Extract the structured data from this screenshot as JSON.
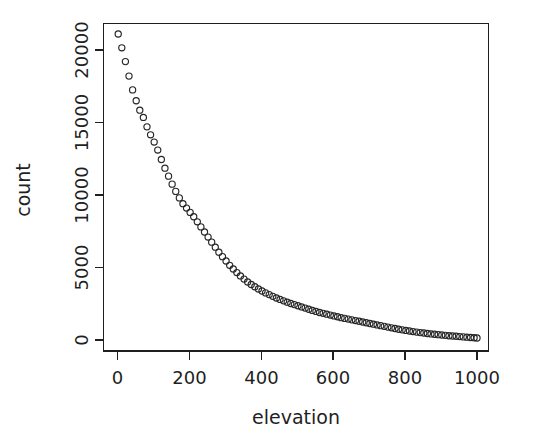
{
  "figure": {
    "background_color": "#ffffff",
    "foreground_color": "#1f1f1f",
    "point_color": "#262626",
    "width": 533,
    "height": 448
  },
  "chart_data": {
    "type": "scatter",
    "title": "",
    "subtitle": "",
    "xlabel": "elevation",
    "ylabel": "count",
    "xlim": [
      -25,
      1025
    ],
    "ylim": [
      -700,
      22400
    ],
    "grid": false,
    "legend": null,
    "legend_position": "none",
    "marker": "open-circle",
    "marker_size_px": 6.2,
    "xticks": [
      0,
      200,
      400,
      600,
      800,
      1000
    ],
    "xtick_labels": [
      "0",
      "200",
      "400",
      "600",
      "800",
      "1000"
    ],
    "yticks": [
      0,
      5000,
      10000,
      15000,
      20000
    ],
    "ytick_labels": [
      "0",
      "5000",
      "10000",
      "15000",
      "20000"
    ],
    "ytick_label_rotation": 90,
    "annotations": [],
    "series": [
      {
        "name": "elevation histogram counts",
        "x": [
          2,
          12,
          22,
          32,
          42,
          52,
          62,
          72,
          82,
          92,
          102,
          112,
          122,
          132,
          142,
          152,
          162,
          172,
          182,
          192,
          202,
          212,
          222,
          232,
          242,
          252,
          262,
          272,
          282,
          292,
          302,
          312,
          322,
          332,
          342,
          352,
          362,
          372,
          382,
          392,
          402,
          412,
          422,
          432,
          442,
          452,
          462,
          472,
          482,
          492,
          502,
          512,
          522,
          532,
          542,
          552,
          562,
          572,
          582,
          592,
          602,
          612,
          622,
          632,
          642,
          652,
          662,
          672,
          682,
          692,
          702,
          712,
          722,
          732,
          742,
          752,
          762,
          772,
          782,
          792,
          802,
          812,
          822,
          832,
          842,
          852,
          862,
          872,
          882,
          892,
          902,
          912,
          922,
          932,
          942,
          952,
          962,
          972,
          982,
          992,
          1000
        ],
        "y": [
          21100,
          20150,
          19200,
          18200,
          17250,
          16500,
          15850,
          15350,
          14700,
          14150,
          13650,
          13100,
          12450,
          11850,
          11300,
          10750,
          10250,
          9800,
          9400,
          9100,
          8800,
          8500,
          8150,
          7800,
          7450,
          7100,
          6750,
          6400,
          6050,
          5750,
          5450,
          5150,
          4900,
          4650,
          4420,
          4200,
          4000,
          3830,
          3670,
          3520,
          3380,
          3250,
          3130,
          3010,
          2900,
          2800,
          2700,
          2610,
          2520,
          2440,
          2360,
          2280,
          2200,
          2120,
          2040,
          1970,
          1900,
          1840,
          1780,
          1720,
          1660,
          1600,
          1540,
          1490,
          1440,
          1390,
          1340,
          1290,
          1240,
          1190,
          1140,
          1090,
          1040,
          990,
          940,
          890,
          840,
          790,
          740,
          700,
          660,
          620,
          580,
          545,
          510,
          480,
          450,
          420,
          395,
          370,
          345,
          320,
          295,
          275,
          255,
          235,
          215,
          195,
          175,
          155,
          140
        ]
      }
    ]
  },
  "axes": {
    "x_axis_label": "elevation",
    "y_axis_label": "count"
  }
}
